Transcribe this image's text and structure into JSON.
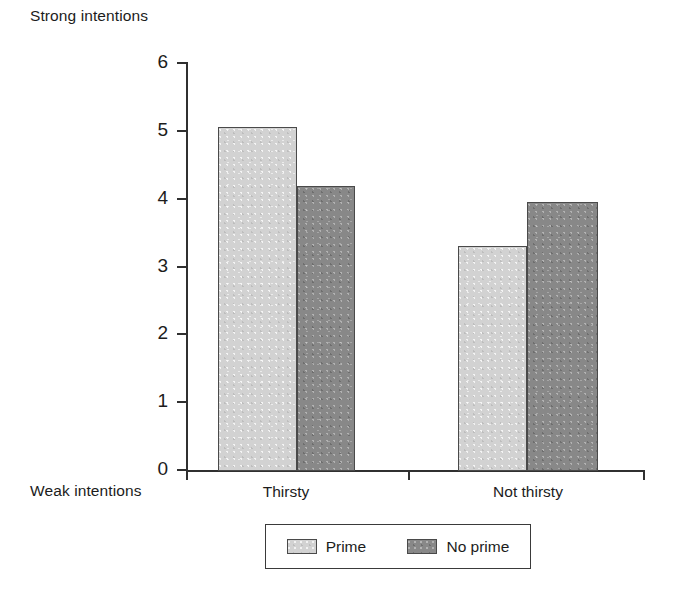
{
  "chart_data": {
    "type": "bar",
    "title": "",
    "subtitle": "",
    "xlabel": "",
    "ylabel": "",
    "ylim": [
      0,
      6
    ],
    "ytick_labels": [
      "6",
      "5",
      "4",
      "3",
      "2",
      "1",
      "0"
    ],
    "ytick_values": [
      6,
      5,
      4,
      3,
      2,
      1,
      0
    ],
    "grid": false,
    "categories": [
      "Thirsty",
      "Not thirsty"
    ],
    "series": [
      {
        "name": "Prime",
        "color": "#d2d2d2",
        "values": [
          5.05,
          3.3
        ]
      },
      {
        "name": "No prime",
        "color": "#888888",
        "values": [
          4.18,
          3.95
        ]
      }
    ],
    "annotations": {
      "axis_top_caption": "Strong intentions",
      "axis_bottom_caption": "Weak intentions"
    },
    "legend": {
      "position": "bottom-center",
      "entries": [
        {
          "label": "Prime",
          "swatch": "light-gray-swatch"
        },
        {
          "label": "No prime",
          "swatch": "dark-gray-swatch"
        }
      ]
    }
  },
  "colors": {
    "prime": "#d2d2d2",
    "no_prime": "#888888",
    "axis": "#303030",
    "text": "#1c1c1c",
    "background": "#ffffff"
  }
}
